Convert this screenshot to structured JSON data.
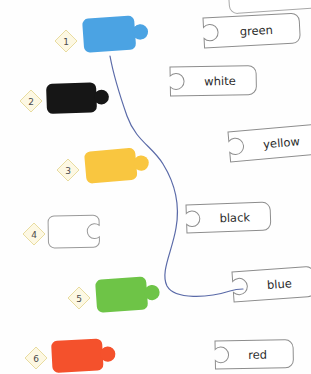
{
  "canvas": {
    "width": 311,
    "height": 374,
    "background": "#fefefe",
    "title": "color puzzle piece matching worksheet"
  },
  "style": {
    "badge_fill": "#fdf8e3",
    "badge_stroke": "#e8dca0",
    "badge_text_color": "#4a4a4a",
    "tag_fill": "#ffffff",
    "tag_stroke": "#8d8d8d",
    "tag_text_color": "#2b2b2b",
    "connector_color": "#5a6aa8",
    "connector_width": 1.2
  },
  "pieces": [
    {
      "number": "1",
      "color_name": "blue",
      "fill": "#4ba3e3",
      "stroke": "none",
      "badge": {
        "cx": 66,
        "cy": 41
      },
      "body": {
        "x": 82,
        "y": 19,
        "w": 57,
        "h": 34,
        "rotate": -4
      },
      "connected": true
    },
    {
      "number": "2",
      "color_name": "black",
      "fill": "#161616",
      "stroke": "none",
      "badge": {
        "cx": 31,
        "cy": 101
      },
      "body": {
        "x": 46,
        "y": 84,
        "w": 55,
        "h": 30,
        "rotate": -2
      },
      "connected": false
    },
    {
      "number": "3",
      "color_name": "yellow",
      "fill": "#f9c640",
      "stroke": "none",
      "badge": {
        "cx": 68,
        "cy": 170
      },
      "body": {
        "x": 84,
        "y": 152,
        "w": 56,
        "h": 32,
        "rotate": -5
      },
      "connected": false
    },
    {
      "number": "4",
      "color_name": "white",
      "fill": "#ffffff",
      "stroke": "#9a9a9a",
      "badge": {
        "cx": 34,
        "cy": 234
      },
      "body": {
        "x": 48,
        "y": 216,
        "w": 56,
        "h": 32,
        "rotate": -1
      },
      "connected": false
    },
    {
      "number": "5",
      "color_name": "green",
      "fill": "#6ec447",
      "stroke": "none",
      "badge": {
        "cx": 79,
        "cy": 298
      },
      "body": {
        "x": 95,
        "y": 280,
        "w": 56,
        "h": 33,
        "rotate": -4
      },
      "connected": false
    },
    {
      "number": "6",
      "color_name": "red",
      "fill": "#f4512c",
      "stroke": "none",
      "badge": {
        "cx": 36,
        "cy": 358
      },
      "body": {
        "x": 51,
        "y": 341,
        "w": 56,
        "h": 32,
        "rotate": -3
      },
      "connected": false
    }
  ],
  "tags": [
    {
      "label": "green",
      "x": 203,
      "y": 18,
      "w": 96,
      "h": 30,
      "rotate": -3,
      "connected": false
    },
    {
      "label": "white",
      "x": 170,
      "y": 67,
      "w": 86,
      "h": 29,
      "rotate": -1,
      "connected": false
    },
    {
      "label": "yellow",
      "x": 228,
      "y": 132,
      "w": 92,
      "h": 30,
      "rotate": -5,
      "connected": false
    },
    {
      "label": "black",
      "x": 186,
      "y": 205,
      "w": 84,
      "h": 28,
      "rotate": -2,
      "connected": false
    },
    {
      "label": "blue",
      "x": 232,
      "y": 272,
      "w": 82,
      "h": 30,
      "rotate": -4,
      "connected": true
    },
    {
      "label": "red",
      "x": 215,
      "y": 341,
      "w": 78,
      "h": 28,
      "rotate": -1,
      "connected": false
    }
  ],
  "partial_tag_top": {
    "x": 228,
    "y": -14,
    "w": 92,
    "h": 28,
    "rotate": -4
  },
  "connector": {
    "from_piece": "1",
    "to_tag": "blue",
    "path": "M110,56 C114,78 120,96 127,116 C136,141 152,146 163,164 C176,185 180,206 176,228 C172,252 160,272 167,286 C175,300 208,298 230,291 C236,289 240,289 243,289"
  }
}
